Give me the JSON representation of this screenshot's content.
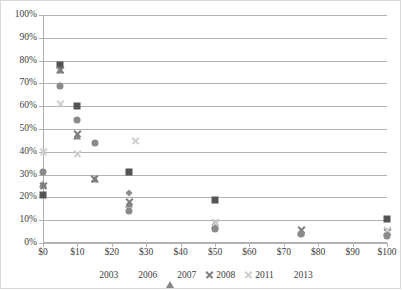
{
  "chart_data": {
    "type": "scatter",
    "title": "",
    "xlabel": "",
    "ylabel": "",
    "xlim": [
      0,
      100
    ],
    "ylim": [
      0,
      1.0
    ],
    "grid": "horizontal",
    "legend_position": "bottom-center",
    "x_tick_labels": [
      "$0",
      "$10",
      "$20",
      "$30",
      "$40",
      "$50",
      "$60",
      "$70",
      "$80",
      "$90",
      "$100"
    ],
    "x_tick_values": [
      0,
      10,
      20,
      30,
      40,
      50,
      60,
      70,
      80,
      90,
      100
    ],
    "y_tick_labels": [
      "0%",
      "10%",
      "20%",
      "30%",
      "40%",
      "50%",
      "60%",
      "70%",
      "80%",
      "90%",
      "100%"
    ],
    "y_tick_values": [
      0,
      10,
      20,
      30,
      40,
      50,
      60,
      70,
      80,
      90,
      100
    ],
    "series": [
      {
        "name": "2003",
        "marker": "diamond",
        "color": "#8c8c8c",
        "points": [
          {
            "x": 0,
            "y": 25
          },
          {
            "x": 25,
            "y": 22
          },
          {
            "x": 50,
            "y": 8
          },
          {
            "x": 75,
            "y": 4
          },
          {
            "x": 100,
            "y": 4
          }
        ]
      },
      {
        "name": "2006",
        "marker": "square",
        "color": "#545454",
        "points": [
          {
            "x": 0,
            "y": 21
          },
          {
            "x": 5,
            "y": 78
          },
          {
            "x": 10,
            "y": 60
          },
          {
            "x": 25,
            "y": 31
          },
          {
            "x": 50,
            "y": 19
          },
          {
            "x": 100,
            "y": 10.5
          }
        ]
      },
      {
        "name": "2007",
        "marker": "triangle",
        "color": "#868686",
        "points": [
          {
            "x": 0,
            "y": 26
          },
          {
            "x": 5,
            "y": 76
          },
          {
            "x": 10,
            "y": 47
          },
          {
            "x": 15,
            "y": 28
          },
          {
            "x": 25,
            "y": 17
          },
          {
            "x": 50,
            "y": 8
          },
          {
            "x": 75,
            "y": 5
          },
          {
            "x": 100,
            "y": 5
          }
        ]
      },
      {
        "name": "2008",
        "marker": "x",
        "color": "#7d7d7d",
        "points": [
          {
            "x": 0,
            "y": 25
          },
          {
            "x": 5,
            "y": 76
          },
          {
            "x": 10,
            "y": 48
          },
          {
            "x": 15,
            "y": 28
          },
          {
            "x": 25,
            "y": 18
          },
          {
            "x": 50,
            "y": 9
          },
          {
            "x": 75,
            "y": 6
          },
          {
            "x": 100,
            "y": 5
          }
        ]
      },
      {
        "name": "2011",
        "marker": "x-light",
        "color": "#cfcfcf",
        "points": [
          {
            "x": 0,
            "y": 40
          },
          {
            "x": 5,
            "y": 61
          },
          {
            "x": 10,
            "y": 39
          },
          {
            "x": 27,
            "y": 45
          },
          {
            "x": 50,
            "y": 9
          },
          {
            "x": 100,
            "y": 6
          }
        ]
      },
      {
        "name": "2013",
        "marker": "circle",
        "color": "#8a8a8a",
        "points": [
          {
            "x": 0,
            "y": 31
          },
          {
            "x": 5,
            "y": 69
          },
          {
            "x": 10,
            "y": 54
          },
          {
            "x": 15,
            "y": 44
          },
          {
            "x": 25,
            "y": 14
          },
          {
            "x": 50,
            "y": 6
          },
          {
            "x": 75,
            "y": 4
          },
          {
            "x": 100,
            "y": 3
          }
        ]
      }
    ]
  }
}
